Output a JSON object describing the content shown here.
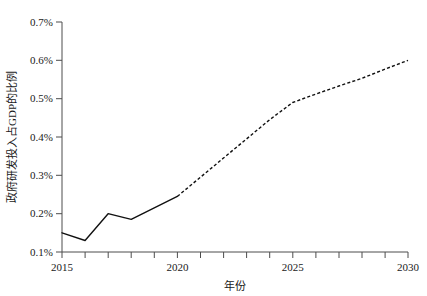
{
  "chart_data": {
    "type": "line",
    "title": "",
    "subtitle": "",
    "xlabel": "年份",
    "ylabel": "政府研发投入占GDP的比例",
    "xlim": [
      2015,
      2030
    ],
    "ylim": [
      0.1,
      0.7
    ],
    "x_tick_labels": [
      "2015",
      "2020",
      "2025",
      "2030"
    ],
    "x_ticks": [
      2015,
      2020,
      2025,
      2030
    ],
    "x_minor_tick_interval": 1,
    "y_tick_labels": [
      "0.1%",
      "0.2%",
      "0.3%",
      "0.4%",
      "0.5%",
      "0.6%",
      "0.7%"
    ],
    "y_ticks": [
      0.1,
      0.2,
      0.3,
      0.4,
      0.5,
      0.6,
      0.7
    ],
    "y_unit": "%",
    "grid": false,
    "legend": false,
    "legend_position": "none",
    "line_color": "#111111",
    "axis_color": "#4d4d4d",
    "x": [
      2015,
      2016,
      2017,
      2018,
      2019,
      2020,
      2021,
      2022,
      2023,
      2024,
      2025,
      2026,
      2027,
      2028,
      2029,
      2030
    ],
    "series": [
      {
        "name": "历史",
        "style": "solid",
        "x": [
          2015,
          2016,
          2017,
          2018,
          2019,
          2020
        ],
        "values": [
          0.15,
          0.13,
          0.2,
          0.185,
          0.215,
          0.245
        ]
      },
      {
        "name": "预测",
        "style": "dashed",
        "x": [
          2020,
          2021,
          2022,
          2023,
          2024,
          2025,
          2026,
          2027,
          2028,
          2029,
          2030
        ],
        "values": [
          0.245,
          0.295,
          0.345,
          0.395,
          0.445,
          0.49,
          0.512,
          0.533,
          0.553,
          0.577,
          0.6
        ]
      }
    ]
  },
  "labels": {
    "x_axis_title": "年份",
    "y_axis_title": "政府研发投入占GDP的比例"
  }
}
